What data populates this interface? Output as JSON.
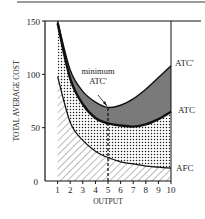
{
  "chart_data": {
    "type": "area",
    "title": "",
    "xlabel": "OUTPUT",
    "ylabel": "TOTAL AVERAGE COST",
    "xlim": [
      0,
      10
    ],
    "ylim": [
      0,
      150
    ],
    "x_ticks": [
      "1",
      "2",
      "3",
      "4",
      "5",
      "6",
      "7",
      "8",
      "9",
      "10"
    ],
    "y_ticks": [
      "0",
      "50",
      "100",
      "150"
    ],
    "grid": false,
    "x": [
      1,
      2,
      3,
      4,
      5,
      6,
      7,
      8,
      9,
      10
    ],
    "series": [
      {
        "name": "ATC'",
        "values": [
          150,
          104,
          84,
          74,
          69,
          71,
          77,
          86,
          97,
          108
        ],
        "fill": "#777777"
      },
      {
        "name": "ATC",
        "values": [
          148,
          96,
          72,
          59,
          54,
          52,
          51,
          53,
          58,
          65
        ],
        "fill": "dotted"
      },
      {
        "name": "AFC",
        "values": [
          98,
          55,
          38,
          28,
          22,
          18,
          16,
          14,
          13,
          12
        ],
        "fill": "hatched"
      }
    ],
    "annotations": [
      {
        "text": "minimum ATC'",
        "x": 5,
        "y": 69,
        "arrow": true
      },
      {
        "type": "dashed-vertical",
        "x": 5,
        "from": 0,
        "to": 69
      }
    ],
    "labels": {
      "atc_prime": "ATC'",
      "atc": "ATC",
      "afc": "AFC",
      "min_line1": "minimum",
      "min_line2": "ATC'"
    }
  }
}
